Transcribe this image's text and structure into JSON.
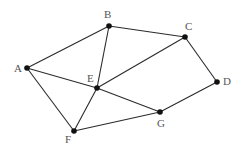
{
  "graph": {
    "nodes": [
      {
        "id": "A",
        "label": "A",
        "x": 27,
        "y": 68,
        "lx": 14,
        "ly": 72
      },
      {
        "id": "B",
        "label": "B",
        "x": 109,
        "y": 26,
        "lx": 104,
        "ly": 18
      },
      {
        "id": "C",
        "label": "C",
        "x": 185,
        "y": 37,
        "lx": 185,
        "ly": 30
      },
      {
        "id": "D",
        "label": "D",
        "x": 217,
        "y": 82,
        "lx": 223,
        "ly": 85
      },
      {
        "id": "E",
        "label": "E",
        "x": 97,
        "y": 88,
        "lx": 87,
        "ly": 82
      },
      {
        "id": "F",
        "label": "F",
        "x": 74,
        "y": 131,
        "lx": 65,
        "ly": 143
      },
      {
        "id": "G",
        "label": "G",
        "x": 160,
        "y": 112,
        "lx": 157,
        "ly": 127
      }
    ],
    "edges": [
      [
        "A",
        "B"
      ],
      [
        "B",
        "C"
      ],
      [
        "A",
        "E"
      ],
      [
        "A",
        "F"
      ],
      [
        "B",
        "E"
      ],
      [
        "C",
        "E"
      ],
      [
        "C",
        "D"
      ],
      [
        "D",
        "G"
      ],
      [
        "E",
        "G"
      ],
      [
        "E",
        "F"
      ],
      [
        "F",
        "G"
      ]
    ]
  }
}
